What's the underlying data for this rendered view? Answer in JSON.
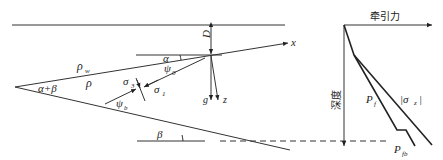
{
  "wedge_diagram": {
    "labels": {
      "depth": "D",
      "alpha": "α",
      "psi0": "ψ",
      "psi0_sub": "0",
      "x_axis": "x",
      "rho_w": "ρ",
      "rho_w_sub": "w",
      "rho": "ρ",
      "apex_angle": "α+β",
      "sigma3": "σ",
      "sigma3_sub": "3",
      "sigma1": "σ",
      "sigma1_sub": "1",
      "psi_b": "ψ",
      "psi_b_sub": "b",
      "g": "g",
      "z": "z",
      "beta": "β"
    }
  },
  "force_chart": {
    "x_axis_label": "牵引力",
    "y_axis_label": "深度",
    "curves": [
      {
        "name": "Pf",
        "label": "P",
        "sub": "f"
      },
      {
        "name": "sigma_z",
        "label": "|σ",
        "sub": "z",
        "suffix": "|"
      },
      {
        "name": "Pfb",
        "label": "P",
        "sub": "fb"
      }
    ]
  }
}
